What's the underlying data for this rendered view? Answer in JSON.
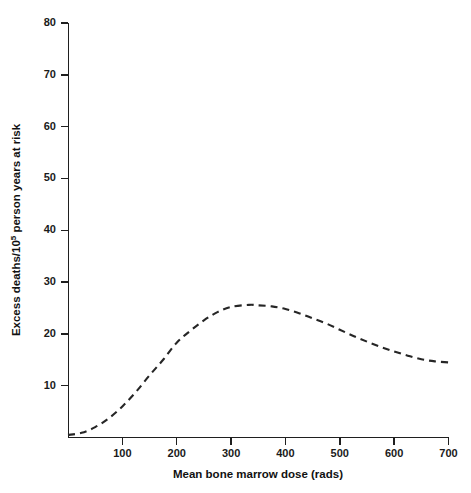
{
  "chart_data": {
    "type": "line",
    "title": "",
    "subtitle": "",
    "xlabel": "Mean bone marrow dose (rads)",
    "ylabel": "Excess deaths/10⁵ person years at risk",
    "ylabel_prefix": "Excess deaths/10",
    "ylabel_superscript": "5",
    "ylabel_suffix": " person years at risk",
    "xlim": [
      0,
      700
    ],
    "ylim": [
      0,
      80
    ],
    "xticks": [
      100,
      200,
      300,
      400,
      500,
      600,
      700
    ],
    "xtick_labels": [
      "100",
      "200",
      "300",
      "400",
      "500",
      "600",
      "700"
    ],
    "yticks": [
      10,
      20,
      30,
      40,
      50,
      60,
      70,
      80
    ],
    "ytick_labels": [
      "10",
      "20",
      "30",
      "40",
      "50",
      "60",
      "70",
      "80"
    ],
    "grid": false,
    "legend": null,
    "legend_position": "none",
    "annotations": [],
    "series": [
      {
        "name": "Excess deaths",
        "style": "dashed",
        "color": "#262626",
        "x": [
          0,
          25,
          50,
          75,
          100,
          125,
          150,
          175,
          200,
          225,
          250,
          275,
          300,
          333,
          350,
          375,
          400,
          425,
          450,
          475,
          500,
          525,
          550,
          575,
          600,
          625,
          650,
          675,
          700
        ],
        "y": [
          0.5,
          0.9,
          2.0,
          3.7,
          6.0,
          8.8,
          12.0,
          15.0,
          18.3,
          20.6,
          22.6,
          24.2,
          25.2,
          25.6,
          25.5,
          25.3,
          24.8,
          24.0,
          23.0,
          22.0,
          20.8,
          19.6,
          18.5,
          17.5,
          16.6,
          15.8,
          15.1,
          14.7,
          14.5
        ]
      }
    ],
    "peak": {
      "x": 333,
      "y": 25.6
    },
    "endpoint": {
      "x": 700,
      "y": 14.5
    },
    "origin_value": {
      "x": 0,
      "y": 0.5
    }
  },
  "figure": {
    "background_color": "#ffffff",
    "axis_color": "#1f1f1f",
    "curve_color": "#262626"
  }
}
